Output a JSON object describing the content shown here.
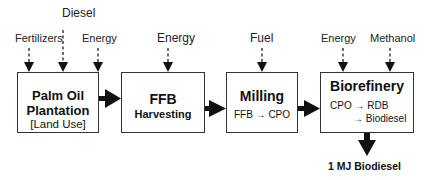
{
  "diagram": {
    "inputs": [
      {
        "label": "Fertilizers",
        "target": "plantation"
      },
      {
        "label": "Diesel",
        "target": "plantation"
      },
      {
        "label": "Energy",
        "target": "plantation"
      },
      {
        "label": "Energy",
        "target": "harvesting"
      },
      {
        "label": "Fuel",
        "target": "milling"
      },
      {
        "label": "Energy",
        "target": "biorefinery"
      },
      {
        "label": "Methanol",
        "target": "biorefinery"
      }
    ],
    "stages": [
      {
        "id": "plantation",
        "title": "Palm Oil",
        "title2": "Plantation",
        "sub": "[Land Use]"
      },
      {
        "id": "harvesting",
        "title": "FFB",
        "sub": "Harvesting"
      },
      {
        "id": "milling",
        "title": "Milling",
        "sub": "FFB → CPO"
      },
      {
        "id": "biorefinery",
        "title": "Biorefinery",
        "sub": "CPO → RDB",
        "sub2": "→ Biodiesel"
      }
    ],
    "output": "1 MJ Biodiesel"
  }
}
